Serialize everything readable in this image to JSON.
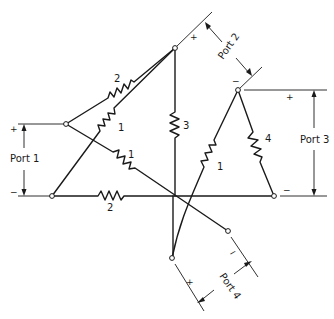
{
  "diagram": {
    "type": "four-port resistive network",
    "ports": [
      {
        "id": "port1",
        "label": "Port 1",
        "plus": "+",
        "minus": "−"
      },
      {
        "id": "port2",
        "label": "Port 2",
        "plus": "+",
        "minus": "−"
      },
      {
        "id": "port3",
        "label": "Port 3",
        "plus": "+",
        "minus": "−"
      },
      {
        "id": "port4",
        "label": "Port 4",
        "plus": "+",
        "minus": "−"
      }
    ],
    "resistors": [
      {
        "id": "r-top-left",
        "value": "2"
      },
      {
        "id": "r-left-diag",
        "value": "1"
      },
      {
        "id": "r-vertical",
        "value": "3"
      },
      {
        "id": "r-cross",
        "value": "1"
      },
      {
        "id": "r-bottom",
        "value": "2"
      },
      {
        "id": "r-port4-diag",
        "value": "1"
      },
      {
        "id": "r-right",
        "value": "4"
      }
    ]
  }
}
